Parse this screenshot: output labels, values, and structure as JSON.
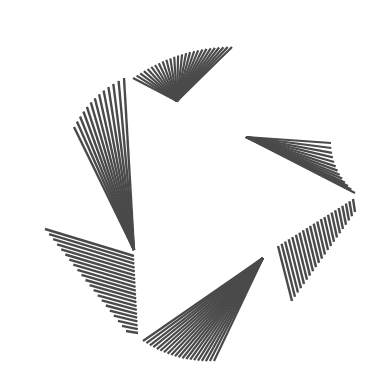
{
  "artwork": {
    "title": "Radial line fans forming a triangular rotating logo",
    "stroke_color": "#4a4a4a",
    "background": "#ffffff",
    "fans": [
      {
        "name": "fan-top",
        "mode": "apex",
        "apex": [
          177,
          101
        ],
        "from": [
          133,
          78
        ],
        "to": [
          232,
          47
        ],
        "count": 26,
        "width": 2.2,
        "arc_bulge": -8
      },
      {
        "name": "fan-left-upper",
        "mode": "apex",
        "apex": [
          134,
          250
        ],
        "from": [
          74,
          127
        ],
        "to": [
          124,
          78
        ],
        "count": 13,
        "width": 2.4,
        "arc_bulge": -6
      },
      {
        "name": "fan-right",
        "mode": "apex",
        "apex": [
          246,
          137
        ],
        "from": [
          331,
          143
        ],
        "to": [
          355,
          193
        ],
        "count": 13,
        "width": 2.2,
        "arc_bulge": 6
      },
      {
        "name": "fan-right-lower",
        "mode": "pairs",
        "start_from": [
          278,
          246
        ],
        "start_to": [
          353,
          199
        ],
        "end_from": [
          292,
          301
        ],
        "end_to": [
          355,
          212
        ],
        "count": 22,
        "width": 2.4
      },
      {
        "name": "fan-bottom",
        "mode": "apex",
        "apex": [
          263,
          258
        ],
        "from": [
          143,
          341
        ],
        "to": [
          214,
          361
        ],
        "count": 20,
        "width": 2.2,
        "arc_bulge": 6
      },
      {
        "name": "fan-left-lower",
        "mode": "pairs",
        "start_from": [
          45,
          229
        ],
        "start_to": [
          126,
          331
        ],
        "end_from": [
          134,
          256
        ],
        "end_to": [
          138,
          333
        ],
        "count": 21,
        "width": 2.4
      }
    ]
  }
}
